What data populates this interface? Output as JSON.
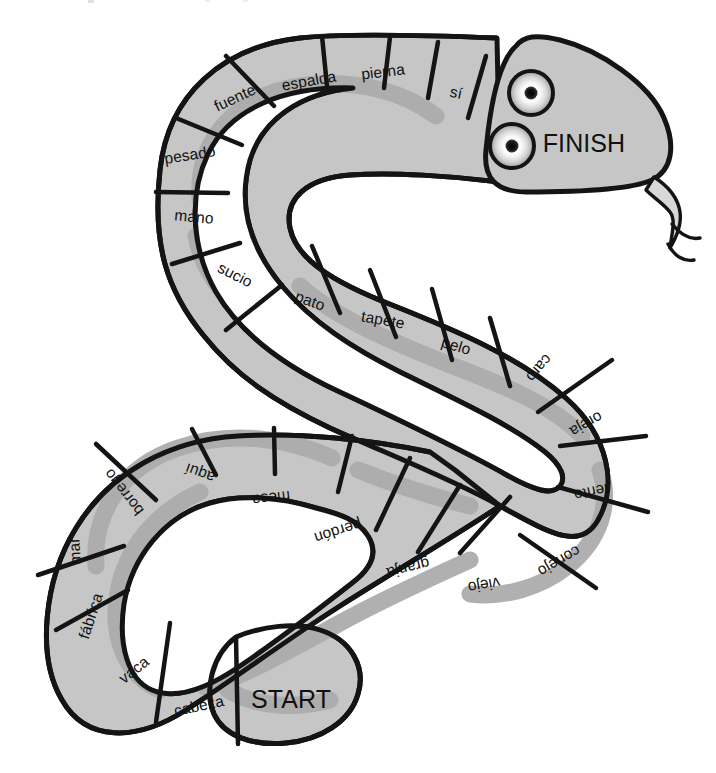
{
  "board": {
    "title": "Snake board game path",
    "colors": {
      "body_fill": "#c6c6c6",
      "body_stripe": "#ababab",
      "outline": "#141414",
      "text": "#111111",
      "background": "#ffffff",
      "eye_outer": "#ffffff",
      "eye_pupil": "#111111"
    },
    "start_label": "START",
    "finish_label": "FINISH"
  },
  "spaces": [
    {
      "label": "START",
      "x": 291,
      "y": 699,
      "rot": 0,
      "kind": "marker"
    },
    {
      "label": "cabeza",
      "x": 199,
      "y": 706,
      "rot": -12,
      "kind": "word"
    },
    {
      "label": "vaca",
      "x": 134,
      "y": 670,
      "rot": -38,
      "kind": "word"
    },
    {
      "label": "fábrica",
      "x": 91,
      "y": 616,
      "rot": -72,
      "kind": "word"
    },
    {
      "label": "mar",
      "x": 75,
      "y": 551,
      "rot": -93,
      "kind": "word"
    },
    {
      "label": "borrego",
      "x": 124,
      "y": 492,
      "rot": -128,
      "kind": "word"
    },
    {
      "label": "aquí",
      "x": 200,
      "y": 473,
      "rot": -160,
      "kind": "word"
    },
    {
      "label": "mesa",
      "x": 271,
      "y": 498,
      "rot": 173,
      "kind": "word"
    },
    {
      "label": "perdón",
      "x": 338,
      "y": 531,
      "rot": 162,
      "kind": "word"
    },
    {
      "label": "granja",
      "x": 408,
      "y": 568,
      "rot": 166,
      "kind": "word"
    },
    {
      "label": "viejo",
      "x": 484,
      "y": 585,
      "rot": 170,
      "kind": "word"
    },
    {
      "label": "conejo",
      "x": 559,
      "y": 561,
      "rot": 150,
      "kind": "word"
    },
    {
      "label": "lento",
      "x": 591,
      "y": 492,
      "rot": 168,
      "kind": "word"
    },
    {
      "label": "oreja",
      "x": 586,
      "y": 424,
      "rot": 150,
      "kind": "word"
    },
    {
      "label": "caro",
      "x": 539,
      "y": 368,
      "rot": 131,
      "kind": "word"
    },
    {
      "label": "pelo",
      "x": 456,
      "y": 346,
      "rot": 17,
      "kind": "word"
    },
    {
      "label": "tapete",
      "x": 383,
      "y": 320,
      "rot": 10,
      "kind": "word"
    },
    {
      "label": "pato",
      "x": 310,
      "y": 301,
      "rot": 20,
      "kind": "word"
    },
    {
      "label": "sucio",
      "x": 235,
      "y": 275,
      "rot": 27,
      "kind": "word"
    },
    {
      "label": "mano",
      "x": 194,
      "y": 217,
      "rot": 5,
      "kind": "word"
    },
    {
      "label": "pesado",
      "x": 190,
      "y": 155,
      "rot": -9,
      "kind": "word"
    },
    {
      "label": "fuente",
      "x": 235,
      "y": 98,
      "rot": -25,
      "kind": "word"
    },
    {
      "label": "espalda",
      "x": 309,
      "y": 81,
      "rot": -10,
      "kind": "word"
    },
    {
      "label": "pierna",
      "x": 383,
      "y": 72,
      "rot": -7,
      "kind": "word"
    },
    {
      "label": "sí",
      "x": 456,
      "y": 93,
      "rot": 12,
      "kind": "word"
    },
    {
      "label": "FINISH",
      "x": 584,
      "y": 143,
      "rot": 0,
      "kind": "marker"
    }
  ],
  "head": {
    "finish_text": "FINISH",
    "eyes": [
      {
        "cx": 531,
        "cy": 93,
        "r": 22
      },
      {
        "cx": 512,
        "cy": 146,
        "r": 22
      }
    ],
    "tongue": "forked-tongue"
  }
}
